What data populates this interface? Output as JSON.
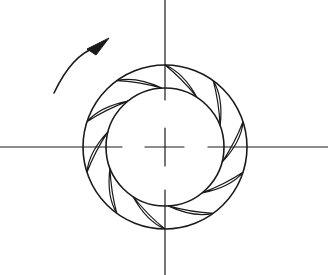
{
  "figure": {
    "type": "impeller-cross-section",
    "background": "#ffffff",
    "line_color": "#1a1a1a",
    "center": [
      165,
      147
    ],
    "outer_radius": 82,
    "inner_radius": 59,
    "blade_count": 10,
    "blade_outer_angles_deg": [
      126,
      90,
      54,
      18,
      -18,
      -54,
      -90,
      -126,
      -162,
      162
    ],
    "blade_sweep_deg": 33,
    "rotation_direction": "counter-clockwise",
    "rotation_arrow": {
      "start": [
        54,
        93
      ],
      "tip": [
        109,
        38
      ]
    },
    "centerlines": {
      "horizontal": {
        "y": 147,
        "segments": [
          [
            0,
            122
          ],
          [
            145,
            184
          ],
          [
            208,
            328
          ]
        ]
      },
      "vertical": {
        "x": 165,
        "segments": [
          [
            0,
            100
          ],
          [
            128,
            166
          ],
          [
            190,
            275
          ]
        ]
      }
    }
  }
}
